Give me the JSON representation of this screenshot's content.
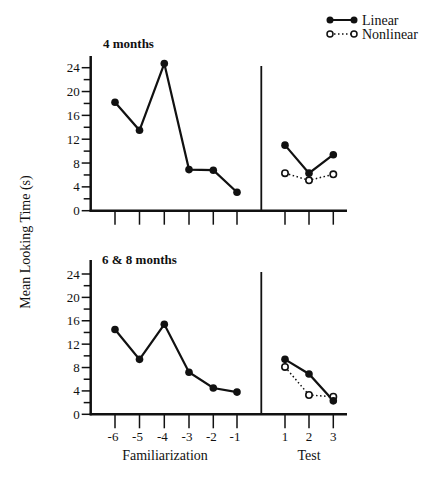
{
  "chart_data": [
    {
      "type": "line",
      "title": "4 months",
      "xlabel": "Familiarization / Test",
      "ylabel": "Mean Looking Time (s)",
      "ylim": [
        0,
        24
      ],
      "yticks": [
        0,
        4,
        8,
        12,
        16,
        20,
        24
      ],
      "familiarization": {
        "x": [
          -6,
          -5,
          -4,
          -3,
          -2,
          -1
        ],
        "values": [
          18.2,
          13.5,
          24.7,
          6.9,
          6.8,
          3.1
        ]
      },
      "test": {
        "x": [
          1,
          2,
          3
        ],
        "series": [
          {
            "name": "Linear",
            "values": [
              11.0,
              6.3,
              9.4
            ]
          },
          {
            "name": "Nonlinear",
            "values": [
              6.3,
              5.1,
              6.1
            ]
          }
        ]
      }
    },
    {
      "type": "line",
      "title": "6 & 8 months",
      "xlabel": "Familiarization / Test",
      "ylabel": "Mean Looking Time (s)",
      "ylim": [
        0,
        24
      ],
      "yticks": [
        0,
        4,
        8,
        12,
        16,
        20,
        24
      ],
      "familiarization": {
        "x": [
          -6,
          -5,
          -4,
          -3,
          -2,
          -1
        ],
        "values": [
          14.5,
          9.4,
          15.4,
          7.2,
          4.5,
          3.8
        ]
      },
      "test": {
        "x": [
          1,
          2,
          3
        ],
        "series": [
          {
            "name": "Linear",
            "values": [
              9.4,
              6.9,
              2.3
            ]
          },
          {
            "name": "Nonlinear",
            "values": [
              8.1,
              3.3,
              3.0
            ]
          }
        ]
      }
    }
  ],
  "labels": {
    "ylabel": "Mean Looking Time (s)",
    "x_familiarization": "Familiarization",
    "x_test": "Test",
    "x_ticks": [
      "-6",
      "-5",
      "-4",
      "-3",
      "-2",
      "-1",
      "1",
      "2",
      "3"
    ],
    "y_ticks": [
      "0",
      "4",
      "8",
      "12",
      "16",
      "20",
      "24"
    ]
  },
  "legend": {
    "items": [
      {
        "label": "Linear",
        "style": "solid-filled"
      },
      {
        "label": "Nonlinear",
        "style": "dotted-open"
      }
    ],
    "position": "top-right"
  },
  "colors": {
    "ink": "#111111",
    "background": "#ffffff"
  }
}
